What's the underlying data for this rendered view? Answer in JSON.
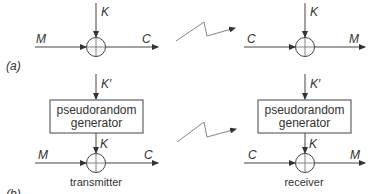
{
  "diagram": {
    "panel_a": {
      "label": "(a)",
      "transmitter": {
        "key": "K",
        "input": "M",
        "output": "C",
        "operator": "xor"
      },
      "receiver": {
        "key": "K",
        "input": "C",
        "output": "M",
        "operator": "xor"
      }
    },
    "panel_b": {
      "label": "(b)",
      "transmitter": {
        "seed": "K′",
        "generator_line1": "pseudorandom",
        "generator_line2": "generator",
        "key": "K",
        "input": "M",
        "output": "C",
        "caption": "transmitter"
      },
      "receiver": {
        "seed": "K′",
        "generator_line1": "pseudorandom",
        "generator_line2": "generator",
        "key": "K",
        "input": "C",
        "output": "M",
        "caption": "receiver"
      }
    },
    "channel_symbol": "wireless-link-zigzag"
  }
}
